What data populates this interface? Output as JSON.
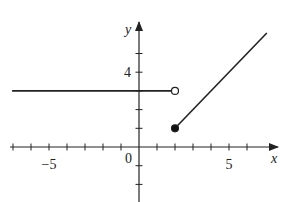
{
  "chart_data": {
    "type": "line",
    "title": "",
    "xlabel": "x",
    "ylabel": "y",
    "xlim": [
      -7.1,
      7.7
    ],
    "ylim": [
      -2.5,
      6.5
    ],
    "x_ticks": [
      -7,
      -6,
      -5,
      -4,
      -3,
      -2,
      -1,
      0,
      1,
      2,
      3,
      4,
      5,
      6
    ],
    "y_ticks": [
      -2,
      -1,
      0,
      1,
      2,
      3,
      4,
      5
    ],
    "x_tick_labels": [
      {
        "value": -5,
        "label": "−5"
      },
      {
        "value": 5,
        "label": "5"
      }
    ],
    "y_tick_labels": [
      {
        "value": 4,
        "label": "4"
      }
    ],
    "origin_label": "0",
    "grid": false,
    "series": [
      {
        "name": "constant piece",
        "x": [
          -7.05,
          2
        ],
        "y": [
          3,
          3
        ],
        "end_marker": "open-circle"
      },
      {
        "name": "linear piece",
        "x": [
          2,
          7.1
        ],
        "y": [
          1,
          6.1
        ],
        "start_marker": "filled-circle",
        "equation": "y = x - 1"
      }
    ],
    "points": [
      {
        "x": 2,
        "y": 3,
        "type": "open"
      },
      {
        "x": 2,
        "y": 1,
        "type": "closed"
      }
    ]
  }
}
